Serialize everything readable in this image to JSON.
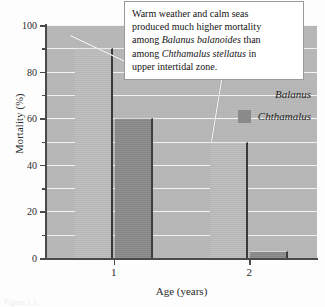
{
  "chart_data": {
    "type": "bar",
    "title": "",
    "xlabel": "Age (years)",
    "ylabel": "Mortality (%)",
    "categories": [
      "1",
      "2"
    ],
    "series": [
      {
        "name": "Balanus",
        "values": [
          90,
          50
        ],
        "color": "#bdbdbd"
      },
      {
        "name": "Chthamalus",
        "values": [
          60,
          3
        ],
        "color": "#8a8a8a"
      }
    ],
    "ylim": [
      0,
      100
    ],
    "yticks_major": [
      0,
      20,
      40,
      60,
      80,
      100
    ],
    "yticks_minor": [
      10,
      30,
      50,
      70,
      90
    ],
    "ytick_labels": [
      "0",
      "20",
      "40",
      "60",
      "80",
      "100"
    ],
    "gridlines": true,
    "grid_interval": 10,
    "legend_position": "upper right",
    "annotations": [
      {
        "text": "Warm weather and calm seas produced much higher mortality among Balanus balanoides than among Chthamalus stellatus in upper intertidal zone.",
        "points_to": [
          "Balanus bar at age 1",
          "Balanus bar at age 2"
        ]
      }
    ]
  },
  "callout": {
    "line1": "Warm weather and calm seas",
    "line2": "produced much higher mortality",
    "line3_pre": "among ",
    "line3_italic": "Balanus balanoides",
    "line3_post": " than",
    "line4_pre": "among ",
    "line4_italic": "Chthamalus stellatus",
    "line4_post": " in",
    "line5": "upper intertidal zone."
  },
  "legend": {
    "items": [
      {
        "label": "Balanus",
        "swatch": "none"
      },
      {
        "label": "Chthamalus",
        "swatch": "filled"
      }
    ]
  },
  "axes": {
    "y_title": "Mortality (%)",
    "x_title": "Age (years)"
  },
  "caption_fragment": "Figure  1.1",
  "colors": {
    "plot_background": "#b9b9b9",
    "balanus_bar": "#bdbdbd",
    "chthamalus_bar": "#8a8a8a",
    "gridline": "#f2f2f2",
    "axis": "#4a4a4a",
    "callout_background": "#ffffff",
    "callout_border": "#9a9a9a",
    "text": "#1e1e1e"
  }
}
